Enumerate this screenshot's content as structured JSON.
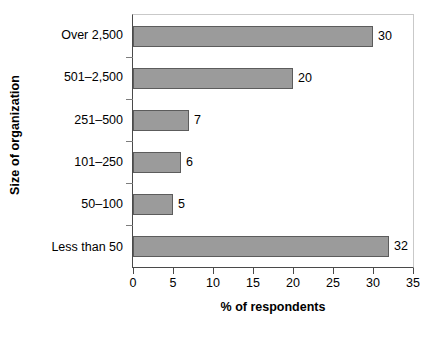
{
  "chart_data": {
    "type": "bar",
    "orientation": "horizontal",
    "title": "",
    "xlabel": "% of respondents",
    "ylabel": "Size of organization",
    "categories": [
      "Less than 50",
      "50–100",
      "101–250",
      "251–500",
      "501–2,500",
      "Over 2,500"
    ],
    "values": [
      32,
      5,
      6,
      7,
      20,
      30
    ],
    "value_labels": [
      "32",
      "5",
      "6",
      "7",
      "20",
      "30"
    ],
    "display_order_top_to_bottom": [
      {
        "category": "Over 2,500",
        "value": 30,
        "label": "30"
      },
      {
        "category": "501–2,500",
        "value": 20,
        "label": "20"
      },
      {
        "category": "251–500",
        "value": 7,
        "label": "7"
      },
      {
        "category": "101–250",
        "value": 6,
        "label": "6"
      },
      {
        "category": "50–100",
        "value": 5,
        "label": "5"
      },
      {
        "category": "Less than 50",
        "value": 32,
        "label": "32"
      }
    ],
    "xlim": [
      0,
      35
    ],
    "xticks": [
      "0",
      "5",
      "10",
      "15",
      "20",
      "25",
      "30",
      "35"
    ],
    "xtick_values": [
      0,
      5,
      10,
      15,
      20,
      25,
      30,
      35
    ],
    "grid": false,
    "legend": null,
    "colors": {
      "bar_fill": "#9b9b9b",
      "bar_border": "#5c5c5c",
      "axis": "#4a4a4a",
      "frame": "#c9c9c9",
      "text": "#000000",
      "background": "#ffffff"
    }
  }
}
